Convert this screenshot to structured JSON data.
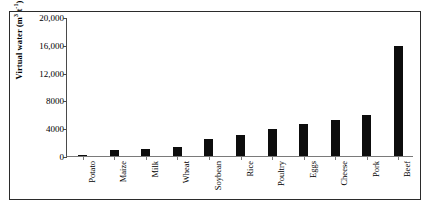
{
  "chart_data": {
    "type": "bar",
    "title": "",
    "xlabel": "",
    "ylabel": "Virtual water (m3 t-1)",
    "ylabel_main": "Virtual water (m",
    "ylabel_sup1": "3",
    "ylabel_mid": " t",
    "ylabel_sup2": "-1",
    "ylabel_end": ")",
    "categories": [
      "Potato",
      "Maize",
      "Milk",
      "Wheat",
      "Soybean",
      "Rice",
      "Poultry",
      "Eggs",
      "Cheese",
      "Pork",
      "Beef"
    ],
    "values": [
      130,
      900,
      1000,
      1300,
      2500,
      3000,
      3900,
      4650,
      5200,
      5900,
      15800
    ],
    "ylim": [
      0,
      20000
    ],
    "yticks": [
      0,
      4000,
      8000,
      12000,
      16000,
      20000
    ],
    "ytick_labels": [
      "0",
      "4000",
      "8000",
      "12,000",
      "16,000",
      "20,000"
    ],
    "grid": false,
    "legend": false,
    "bar_color": "#0d0d0d",
    "axis_color": "#4a4a4a",
    "frame_color": "#2b2b2b",
    "background": "#ffffff",
    "series": [
      {
        "name": "Virtual water content",
        "values": [
          130,
          900,
          1000,
          1300,
          2500,
          3000,
          3900,
          4650,
          5200,
          5900,
          15800
        ]
      }
    ]
  }
}
